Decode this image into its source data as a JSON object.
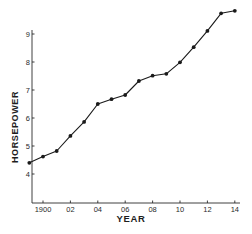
{
  "chart_data": {
    "type": "line",
    "title": "",
    "xlabel": "YEAR",
    "ylabel": "HORSEPOWER",
    "x": [
      1899,
      1900,
      1901,
      1902,
      1903,
      1904,
      1905,
      1906,
      1907,
      1908,
      1909,
      1910,
      1911,
      1912,
      1913,
      1914
    ],
    "series": [
      {
        "name": "Horsepower",
        "values": [
          4.4,
          4.62,
          4.82,
          5.36,
          5.86,
          6.5,
          6.67,
          6.82,
          7.32,
          7.51,
          7.58,
          7.99,
          8.53,
          9.11,
          9.74,
          9.83
        ]
      }
    ],
    "x_ticks": [
      1900,
      1902,
      1904,
      1906,
      1908,
      1910,
      1912,
      1914
    ],
    "x_tick_labels": [
      "1900",
      "02",
      "04",
      "06",
      "08",
      "10",
      "12",
      "14"
    ],
    "y_ticks": [
      4,
      5,
      6,
      7,
      8,
      9
    ],
    "y_tick_labels": [
      "4",
      "5",
      "6",
      "7",
      "8",
      "9"
    ],
    "xlim": [
      1898.2,
      1914.5
    ],
    "ylim": [
      3.0,
      9.9
    ],
    "grid": false,
    "legend": "none",
    "marker": "filled-circle",
    "line_color": "#1a1a1a"
  }
}
